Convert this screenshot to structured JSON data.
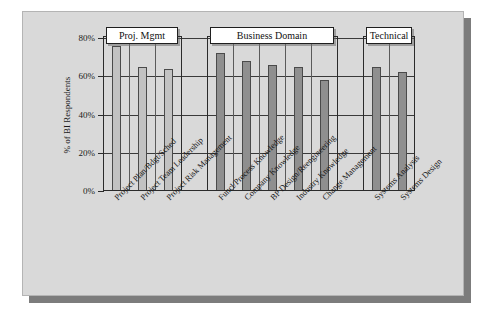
{
  "chart_data": {
    "type": "bar",
    "title": "",
    "xlabel": "",
    "ylabel": "% of BI Respondents",
    "ylim": [
      0,
      80
    ],
    "ytick_labels": [
      "0%",
      "20%",
      "40%",
      "60%",
      "80%"
    ],
    "ytick_values": [
      0,
      20,
      40,
      60,
      80
    ],
    "grid": true,
    "legend": "none",
    "categories": [
      "Project Plan/Bdgt/Sched",
      "Project Team Leadership",
      "Project Risk Management",
      "Funcl/Process Knowledge",
      "Company Knowledge",
      "BP Design/Reengineering",
      "Industry Knowledge",
      "Change Management",
      "Systems Analysis",
      "Systems Design"
    ],
    "values": [
      76,
      65,
      64,
      72,
      68,
      66,
      65,
      58,
      65,
      62
    ],
    "groups": [
      {
        "label": "Proj. Mgmt",
        "categories": [
          "Project Plan/Bdgt/Sched",
          "Project Team Leadership",
          "Project Risk Management"
        ],
        "color": "#c2c2c2"
      },
      {
        "label": "Business Domain",
        "categories": [
          "Funcl/Process Knowledge",
          "Company Knowledge",
          "BP Design/Reengineering",
          "Industry Knowledge",
          "Change Management"
        ],
        "color": "#8f8f8f"
      },
      {
        "label": "Technical",
        "categories": [
          "Systems Analysis",
          "Systems Design"
        ],
        "color": "#8f8f8f"
      }
    ]
  },
  "axis": {
    "y_title": "% of BI Respondents",
    "ticks": [
      {
        "label": "80%",
        "value": 80
      },
      {
        "label": "60%",
        "value": 60
      },
      {
        "label": "40%",
        "value": 40
      },
      {
        "label": "20%",
        "value": 20
      },
      {
        "label": "0%",
        "value": 0
      }
    ]
  },
  "groups": [
    {
      "label": "Proj. Mgmt"
    },
    {
      "label": "Business Domain"
    },
    {
      "label": "Technical"
    }
  ],
  "categories": [
    {
      "label": "Project Plan/Bdgt/Sched",
      "value": 76
    },
    {
      "label": "Project Team Leadership",
      "value": 65
    },
    {
      "label": "Project Risk Management",
      "value": 64
    },
    {
      "label": "Funcl/Process Knowledge",
      "value": 72
    },
    {
      "label": "Company Knowledge",
      "value": 68
    },
    {
      "label": "BP Design/Reengineering",
      "value": 66
    },
    {
      "label": "Industry Knowledge",
      "value": 65
    },
    {
      "label": "Change Management",
      "value": 58
    },
    {
      "label": "Systems Analysis",
      "value": 65
    },
    {
      "label": "Systems Design",
      "value": 62
    }
  ],
  "colors": {
    "panel_background": "#d9d9d9",
    "figure_background": "#ffffff",
    "bar_light": "#c2c2c2",
    "bar_dark": "#8f8f8f",
    "axis": "#2b2b2b",
    "shadow": "#7c7c7c"
  }
}
